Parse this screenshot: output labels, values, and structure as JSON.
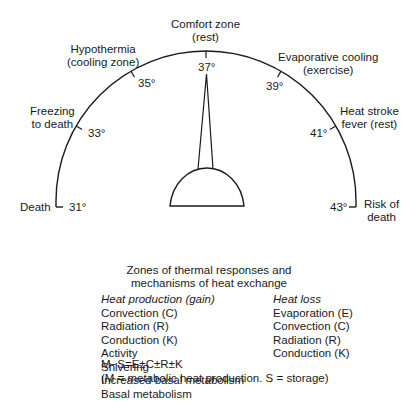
{
  "gauge": {
    "zones": [
      {
        "label_line1": "Death",
        "label_line2": "",
        "temp": "31°"
      },
      {
        "label_line1": "Freezing",
        "label_line2": "to death",
        "temp": "33°"
      },
      {
        "label_line1": "Hypothermia",
        "label_line2": "(cooling zone)",
        "temp": "35°"
      },
      {
        "label_line1": "Comfort zone",
        "label_line2": "(rest)",
        "temp": "37°"
      },
      {
        "label_line1": "Evaporative cooling",
        "label_line2": "(exercise)",
        "temp": "39°"
      },
      {
        "label_line1": "Heat stroke",
        "label_line2": "fever (rest)",
        "temp": "41°"
      },
      {
        "label_line1": "Risk of",
        "label_line2": "death",
        "temp": "43°"
      }
    ],
    "needle_value": "37°",
    "colors": {
      "line": "#1a1a1a",
      "background": "#ffffff"
    }
  },
  "caption": {
    "line1": "Zones of thermal responses and",
    "line2": "mechanisms of heat exchange"
  },
  "heat_production": {
    "header": "Heat production (gain)",
    "items": [
      "Convection (C)",
      "Radiation (R)",
      "Conduction (K)",
      "Activity",
      "Shivering",
      "Increased basal metabolism",
      "Basal metabolism"
    ]
  },
  "heat_loss": {
    "header": "Heat loss",
    "items": [
      "Evaporation (E)",
      "Convection (C)",
      "Radiation (R)",
      "Conduction (K)"
    ]
  },
  "equation": {
    "formula": "M−S=E±C±R±K",
    "legend": "(M = metabolic heat production. S = storage)"
  }
}
